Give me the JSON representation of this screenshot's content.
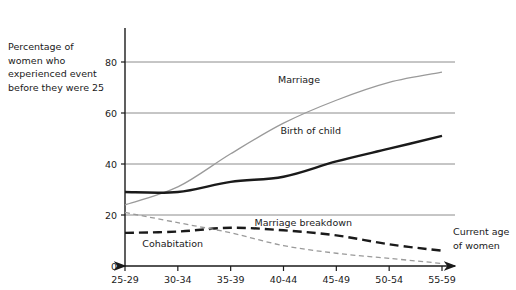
{
  "chart_data": {
    "type": "line",
    "title": "",
    "xlabel": "Current age\nof women",
    "ylabel": "Percentage of\nwomen who\nexperienced event\nbefore they were 25",
    "categories": [
      "25-29",
      "30-34",
      "35-39",
      "40-44",
      "45-49",
      "50-54",
      "55-59"
    ],
    "ylim": [
      0,
      80
    ],
    "yticks": [
      0,
      20,
      40,
      60,
      80
    ],
    "ytick_labels": [
      "0",
      "20",
      "40",
      "60",
      "80"
    ],
    "grid": "horizontal",
    "legend_position": "inline-labels",
    "series": [
      {
        "name": "Marriage",
        "values": [
          24,
          31,
          44,
          56,
          65,
          72,
          76
        ],
        "style": "solid-light",
        "color": "#9a9a9a"
      },
      {
        "name": "Birth of child",
        "values": [
          29,
          29,
          33,
          35,
          41,
          46,
          51
        ],
        "style": "solid-bold",
        "color": "#1a1a1a"
      },
      {
        "name": "Marriage breakdown",
        "values": [
          13,
          13.5,
          15,
          14,
          12,
          8.5,
          6
        ],
        "style": "dashed-bold",
        "color": "#1a1a1a"
      },
      {
        "name": "Cohabitation",
        "values": [
          21,
          17,
          13,
          8,
          5,
          3,
          1
        ],
        "style": "dashed-light",
        "color": "#9a9a9a"
      }
    ],
    "annotations": [
      {
        "text": "Marriage",
        "x": 320,
        "y": 83
      },
      {
        "text": "Birth of child",
        "x": 341,
        "y": 134
      },
      {
        "text": "Marriage breakdown",
        "x": 352,
        "y": 226
      },
      {
        "text": "Cohabitation",
        "x": 203,
        "y": 247
      }
    ]
  },
  "axes": {
    "y_arrow": "up-arrow-icon",
    "x_arrow": "right-arrow-icon"
  }
}
